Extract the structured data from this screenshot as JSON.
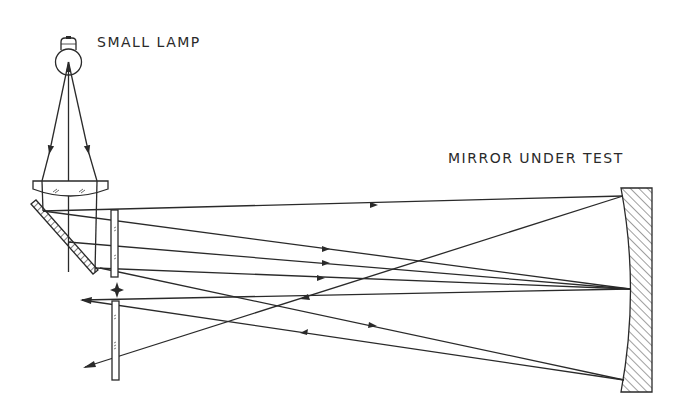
{
  "labels": {
    "lamp": "SMALL LAMP",
    "mirror": "MIRROR UNDER TEST"
  },
  "components": [
    {
      "name": "small-lamp",
      "type": "light-source"
    },
    {
      "name": "condenser-lens",
      "type": "lens"
    },
    {
      "name": "diagonal-mirror",
      "type": "flat-mirror-hatched"
    },
    {
      "name": "upper-plate",
      "type": "glass-plate"
    },
    {
      "name": "pinhole-star",
      "type": "focal-point-marker"
    },
    {
      "name": "lower-plate",
      "type": "glass-plate"
    },
    {
      "name": "mirror-under-test",
      "type": "concave-mirror"
    }
  ],
  "colors": {
    "line": "#2a2a2a",
    "background": "#ffffff"
  }
}
